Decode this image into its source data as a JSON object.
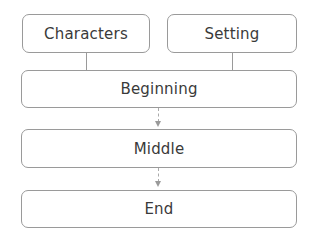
{
  "diagram": {
    "top_boxes": [
      {
        "label": "Characters"
      },
      {
        "label": "Setting"
      }
    ],
    "sequence": [
      {
        "label": "Beginning"
      },
      {
        "label": "Middle"
      },
      {
        "label": "End"
      }
    ],
    "connectors": [
      {
        "from": "Characters",
        "to": "Beginning",
        "style": "solid"
      },
      {
        "from": "Setting",
        "to": "Beginning",
        "style": "solid"
      },
      {
        "from": "Beginning",
        "to": "Middle",
        "style": "dashed-arrow"
      },
      {
        "from": "Middle",
        "to": "End",
        "style": "dashed-arrow"
      }
    ],
    "colors": {
      "border": "#9a9a9a",
      "text": "#3a3a3a",
      "background": "#ffffff"
    }
  }
}
